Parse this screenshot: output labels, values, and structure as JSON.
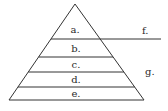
{
  "diagram": {
    "type": "pyramid",
    "stroke_color": "#333333",
    "text_color": "#2a2a2a",
    "levels": [
      {
        "label": "a.",
        "y_top": 4,
        "y_bottom": 39
      },
      {
        "label": "b.",
        "y_top": 39,
        "y_bottom": 57
      },
      {
        "label": "c.",
        "y_top": 57,
        "y_bottom": 72
      },
      {
        "label": "d.",
        "y_top": 72,
        "y_bottom": 87
      },
      {
        "label": "e.",
        "y_top": 87,
        "y_bottom": 100
      }
    ],
    "side_labels": [
      {
        "label": "f.",
        "note": "labels the apex segment above the extended line"
      },
      {
        "label": "g.",
        "note": "labels the lower portion of the pyramid"
      }
    ]
  }
}
